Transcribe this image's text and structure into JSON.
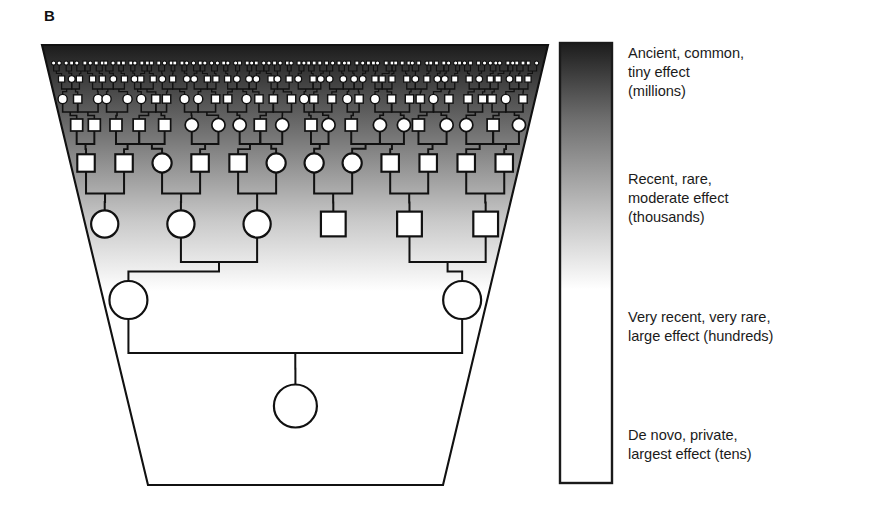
{
  "panel": {
    "label": "B"
  },
  "colorbar": {
    "name": "variant-age-effect-gradient",
    "top_color": "#1c1c1c",
    "bottom_color": "#ffffff",
    "border_color": "#1a1a1a",
    "x": 560,
    "y": 43,
    "width": 52,
    "height": 440
  },
  "legend": {
    "items": [
      {
        "text": "Ancient, common,\ntiny effect\n(millions)",
        "lines": [
          "Ancient, common,",
          "tiny effect",
          "(millions)"
        ]
      },
      {
        "text": "Recent, rare,\nmoderate effect\n(thousands)",
        "lines": [
          "Recent, rare,",
          "moderate effect",
          "(thousands)"
        ]
      },
      {
        "text": "Very recent, very rare,\nlarge effect (hundreds)",
        "lines": [
          "Very recent, very rare,",
          "large effect (hundreds)"
        ]
      },
      {
        "text": "De novo, private,\nlargest effect (tens)",
        "lines": [
          "De novo, private,",
          "largest effect (tens)"
        ]
      }
    ]
  },
  "pedigree": {
    "name": "inverted-pedigree-trapezoid",
    "trapezoid": {
      "top_left_x": 42,
      "top_right_x": 548,
      "bottom_left_x": 148,
      "bottom_right_x": 443,
      "top_y": 45,
      "bottom_y": 485,
      "outline_color": "#111111",
      "gradient_top": "#1c1c1c",
      "gradient_bottom": "#ffffff",
      "gradient_end_fraction": 0.56
    },
    "symbol_shapes": {
      "female": "circle",
      "male": "square"
    },
    "generations": [
      {
        "index": 0,
        "label": "ancient-common-tiny-effect",
        "symbol_radius": 2.1,
        "y": 63,
        "count": 84
      },
      {
        "index": 1,
        "label": "generation-2",
        "symbol_radius": 3.4,
        "y": 79,
        "count": 46
      },
      {
        "index": 2,
        "label": "generation-3",
        "symbol_radius": 4.6,
        "y": 99,
        "count": 32
      },
      {
        "index": 3,
        "label": "generation-4",
        "symbol_radius": 6.6,
        "y": 125,
        "count": 20
      },
      {
        "index": 4,
        "label": "recent-rare-moderate-effect",
        "symbol_radius": 9.6,
        "y": 163,
        "count": 12
      },
      {
        "index": 5,
        "label": "generation-6",
        "symbol_radius": 13.6,
        "y": 224,
        "count": 6
      },
      {
        "index": 6,
        "label": "very-recent-very-rare-large-effect",
        "symbol_radius": 19.0,
        "y": 300,
        "count": 2
      },
      {
        "index": 7,
        "label": "de-novo-private-largest-effect",
        "symbol_radius": 21.5,
        "y": 406,
        "count": 1
      }
    ],
    "line_color": "#111111"
  }
}
